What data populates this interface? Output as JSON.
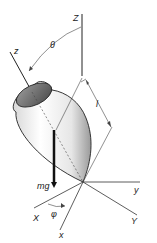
{
  "diagram": {
    "labels": {
      "Z_space": "Z",
      "z_body": "z",
      "theta": "θ",
      "length": "l",
      "weight": "mg",
      "y_body": "y",
      "Y_space": "Y",
      "X_space": "X",
      "x_body": "x",
      "phi": "φ"
    },
    "colors": {
      "line": "#222222",
      "body_light": "#f2f2f2",
      "body_shade": "#9a9a9a",
      "lid": "#6e6e6e",
      "background": "#ffffff"
    }
  }
}
